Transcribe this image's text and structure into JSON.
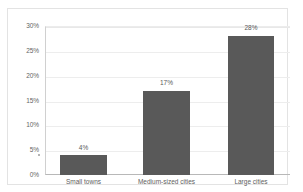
{
  "chart_data": {
    "type": "bar",
    "title": "",
    "subtitle": "",
    "xlabel": "",
    "ylabel": "",
    "categories": [
      "Small towns",
      "Medium-sized cities",
      "Large cities"
    ],
    "values": [
      4,
      17,
      28
    ],
    "value_labels": [
      "4%",
      "17%",
      "28%"
    ],
    "ylim": [
      0,
      30
    ],
    "ytick_values": [
      0,
      5,
      10,
      15,
      20,
      25,
      30
    ],
    "ytick_labels": [
      "0%",
      "5%",
      "10%",
      "15%",
      "20%",
      "25%",
      "30%"
    ],
    "grid": true,
    "legend": false,
    "legend_position": "none",
    "series": [
      {
        "name": "",
        "values": [
          4,
          17,
          28
        ]
      }
    ],
    "colors": {
      "bar_fill": "#595959",
      "gridline": "#ededed",
      "axis_line": "#b8b8b8",
      "frame_border": "#e3e3e3",
      "tick_label": "#646464",
      "value_label": "#595959",
      "category_label": "#5e5e5e",
      "background": "#ffffff"
    }
  }
}
